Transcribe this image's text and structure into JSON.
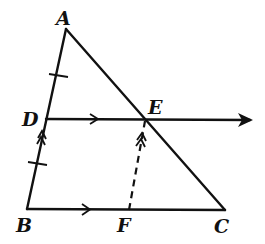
{
  "diagram": {
    "points": {
      "A": {
        "label": "A",
        "x": 66,
        "y": 29
      },
      "B": {
        "label": "B",
        "x": 27,
        "y": 209
      },
      "C": {
        "label": "C",
        "x": 225,
        "y": 210
      },
      "D": {
        "label": "D",
        "x": 46,
        "y": 119
      },
      "E": {
        "label": "E",
        "x": 146,
        "y": 119
      },
      "F": {
        "label": "F",
        "x": 129,
        "y": 210
      }
    },
    "segments": [
      {
        "from": "A",
        "to": "B",
        "style": "solid"
      },
      {
        "from": "A",
        "to": "C",
        "style": "solid"
      },
      {
        "from": "B",
        "to": "C",
        "style": "solid",
        "marker": "single-arrow"
      },
      {
        "from": "D",
        "to": "E",
        "style": "solid-ray",
        "marker": "single-arrow",
        "ray_end": {
          "x": 253,
          "y": 120
        }
      },
      {
        "from": "F",
        "to": "E",
        "style": "dashed",
        "marker": "double-arrow"
      }
    ],
    "annotations": {
      "equal_ticks": [
        "AD",
        "DB"
      ],
      "parallel_single": [
        "DE",
        "BC"
      ],
      "parallel_double": [
        "DB",
        "FE"
      ]
    },
    "colors": {
      "ink": "#111111",
      "background": "#ffffff"
    }
  }
}
